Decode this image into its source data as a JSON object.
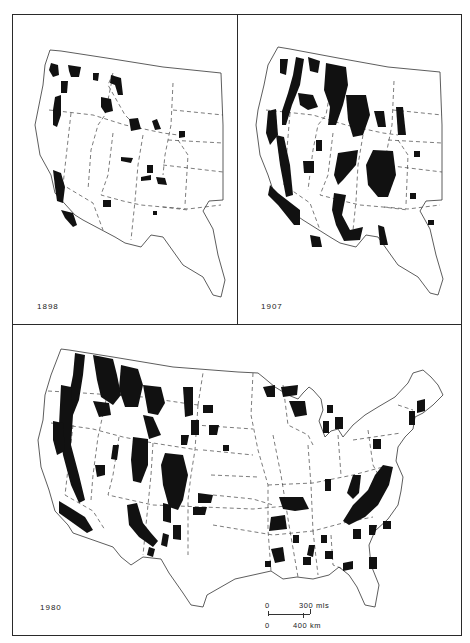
{
  "figure": {
    "panels": [
      {
        "id": "1898",
        "year_label": "1898",
        "extent": "Western United States"
      },
      {
        "id": "1907",
        "year_label": "1907",
        "extent": "Western United States"
      },
      {
        "id": "1980",
        "year_label": "1980",
        "extent": "Conterminous United States"
      }
    ],
    "scale_bar": {
      "miles_zero": "0",
      "miles_label": "300 mls",
      "km_zero": "0",
      "km_label": "400 km"
    },
    "colors": {
      "forest_fill": "#111111",
      "background": "#ffffff",
      "outline": "#333333"
    },
    "legend_semantics": {
      "black_areas": "forest reserve / national forest lands",
      "dashed_lines": "state boundaries"
    }
  }
}
